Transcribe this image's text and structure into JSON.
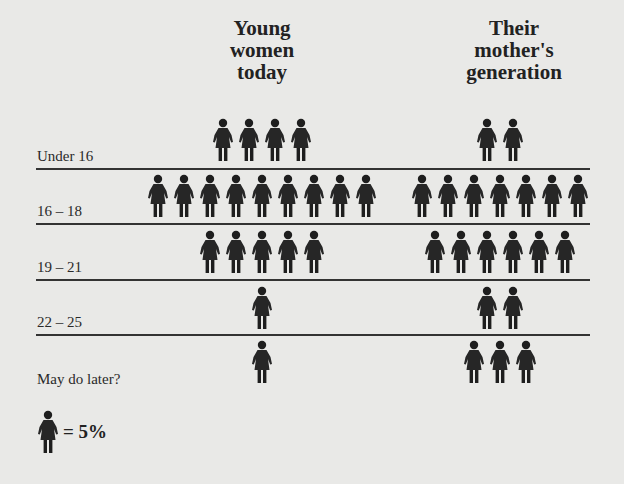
{
  "columns": [
    {
      "title_lines": [
        "Young",
        "women",
        "today"
      ]
    },
    {
      "title_lines": [
        "Their",
        "mother's",
        "generation"
      ]
    }
  ],
  "rows": [
    {
      "label": "Under 16",
      "young": 4,
      "mother": 2
    },
    {
      "label": "16 – 18",
      "young": 9,
      "mother": 7
    },
    {
      "label": "19 – 21",
      "young": 5,
      "mother": 6
    },
    {
      "label": "22 – 25",
      "young": 1,
      "mother": 2
    },
    {
      "label": "May do later?",
      "young": 1,
      "mother": 3
    }
  ],
  "legend": {
    "icon": "woman-figure-icon",
    "text": "= 5%"
  },
  "colors": {
    "background": "#e9e9e7",
    "ink": "#222222"
  },
  "chart_data": {
    "type": "bar",
    "subtype": "pictogram",
    "title": "",
    "unit": "each figure = 5%",
    "categories": [
      "Under 16",
      "16 – 18",
      "19 – 21",
      "22 – 25",
      "May do later?"
    ],
    "series": [
      {
        "name": "Young women today",
        "figures": [
          4,
          9,
          5,
          1,
          1
        ],
        "values": [
          20,
          45,
          25,
          5,
          5
        ]
      },
      {
        "name": "Their mother's generation",
        "figures": [
          2,
          7,
          6,
          2,
          3
        ],
        "values": [
          10,
          35,
          30,
          10,
          15
        ]
      }
    ],
    "xlabel": "",
    "ylabel": "",
    "legend": "woman icon = 5%"
  }
}
